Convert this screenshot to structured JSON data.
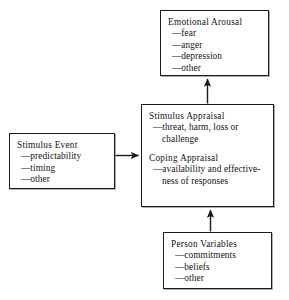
{
  "diagram": {
    "background_color": "#ffffff",
    "line_color": "#1a1a1a",
    "boxes": {
      "emotional_arousal": {
        "heading": "Emotional Arousal",
        "items": [
          "fear",
          "anger",
          "depression",
          "other"
        ]
      },
      "stimulus_event": {
        "heading": "Stimulus Event",
        "items": [
          "predictability",
          "timing",
          "other"
        ]
      },
      "appraisal": {
        "heading_1": "Stimulus Appraisal",
        "items_1": [
          "threat, harm, loss or challenge"
        ],
        "heading_2": "Coping Appraisal",
        "items_2": [
          "availability and effective-ness of responses"
        ]
      },
      "person_variables": {
        "heading": "Person Variables",
        "items": [
          "commitments",
          "beliefs",
          "other"
        ]
      }
    },
    "connectors": [
      {
        "name": "appraisal-to-emotional-arousal",
        "from": "appraisal",
        "to": "emotional_arousal",
        "direction": "up",
        "arrowhead": "single"
      },
      {
        "name": "stimulus-event-to-appraisal",
        "from": "stimulus_event",
        "to": "appraisal",
        "direction": "right",
        "arrowhead": "single"
      },
      {
        "name": "person-variables-to-appraisal",
        "from": "person_variables",
        "to": "appraisal",
        "direction": "up",
        "arrowhead": "single"
      }
    ]
  }
}
